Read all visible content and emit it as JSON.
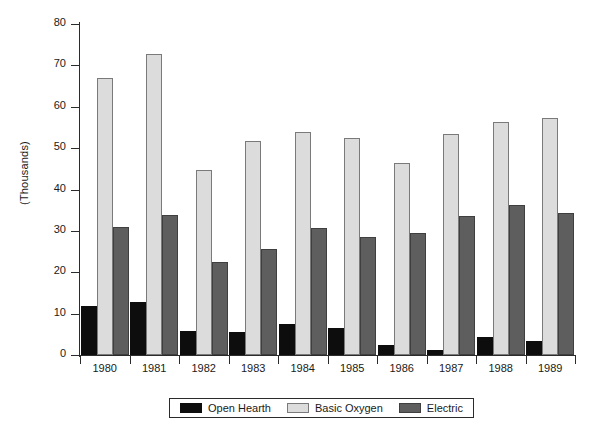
{
  "chart_data": {
    "type": "bar",
    "title": "",
    "xlabel": "",
    "ylabel": "(Thousands)",
    "categories": [
      "1980",
      "1981",
      "1982",
      "1983",
      "1984",
      "1985",
      "1986",
      "1987",
      "1988",
      "1989"
    ],
    "series": [
      {
        "name": "Open Hearth",
        "color": "#0d0d0d",
        "values": [
          11.9,
          12.7,
          5.7,
          5.6,
          7.6,
          6.6,
          2.4,
          1.3,
          4.3,
          3.4
        ]
      },
      {
        "name": "Basic Oxygen",
        "color": "#dcdcdc",
        "values": [
          66.9,
          72.8,
          44.7,
          51.7,
          53.8,
          52.5,
          46.5,
          53.4,
          56.4,
          57.4
        ]
      },
      {
        "name": "Electric",
        "color": "#5e5e5e",
        "values": [
          31.0,
          33.8,
          22.6,
          25.6,
          30.8,
          28.6,
          29.4,
          33.5,
          36.3,
          34.4
        ]
      }
    ],
    "ylim": [
      0,
      80
    ],
    "yticks": [
      0,
      10,
      20,
      30,
      40,
      50,
      60,
      70,
      80
    ],
    "grid": false,
    "legend_position": "bottom"
  }
}
